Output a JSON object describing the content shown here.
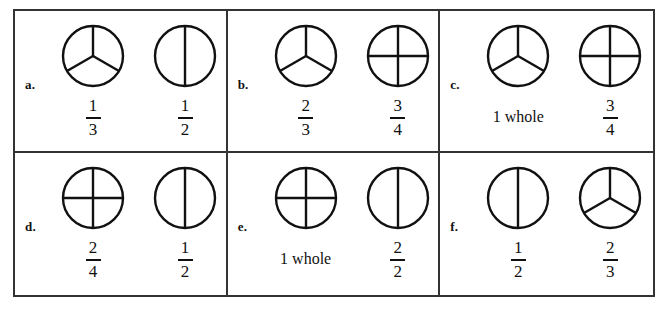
{
  "worksheet": {
    "title": "Fraction circle comparison worksheet",
    "columns": 3,
    "rows": 2,
    "border_color": "#333333",
    "line_color": "#111111",
    "background": "#ffffff"
  },
  "items": [
    {
      "letter": "a.",
      "left": {
        "circle": "thirds",
        "parts": 3,
        "label_type": "fraction",
        "numerator": "1",
        "denominator": "3",
        "label_text": "1/3"
      },
      "right": {
        "circle": "halves",
        "parts": 2,
        "label_type": "fraction",
        "numerator": "1",
        "denominator": "2",
        "label_text": "1/2"
      }
    },
    {
      "letter": "b.",
      "left": {
        "circle": "thirds",
        "parts": 3,
        "label_type": "fraction",
        "numerator": "2",
        "denominator": "3",
        "label_text": "2/3"
      },
      "right": {
        "circle": "quarters",
        "parts": 4,
        "label_type": "fraction",
        "numerator": "3",
        "denominator": "4",
        "label_text": "3/4"
      }
    },
    {
      "letter": "c.",
      "left": {
        "circle": "thirds",
        "parts": 3,
        "label_type": "text",
        "numerator": "",
        "denominator": "",
        "label_text": "1 whole"
      },
      "right": {
        "circle": "quarters",
        "parts": 4,
        "label_type": "fraction",
        "numerator": "3",
        "denominator": "4",
        "label_text": "3/4"
      }
    },
    {
      "letter": "d.",
      "left": {
        "circle": "quarters",
        "parts": 4,
        "label_type": "fraction",
        "numerator": "2",
        "denominator": "4",
        "label_text": "2/4"
      },
      "right": {
        "circle": "halves",
        "parts": 2,
        "label_type": "fraction",
        "numerator": "1",
        "denominator": "2",
        "label_text": "1/2"
      }
    },
    {
      "letter": "e.",
      "left": {
        "circle": "quarters",
        "parts": 4,
        "label_type": "text",
        "numerator": "",
        "denominator": "",
        "label_text": "1 whole"
      },
      "right": {
        "circle": "halves",
        "parts": 2,
        "label_type": "fraction",
        "numerator": "2",
        "denominator": "2",
        "label_text": "2/2"
      }
    },
    {
      "letter": "f.",
      "left": {
        "circle": "halves",
        "parts": 2,
        "label_type": "fraction",
        "numerator": "1",
        "denominator": "2",
        "label_text": "1/2"
      },
      "right": {
        "circle": "thirds",
        "parts": 3,
        "label_type": "fraction",
        "numerator": "2",
        "denominator": "3",
        "label_text": "2/3"
      }
    }
  ]
}
